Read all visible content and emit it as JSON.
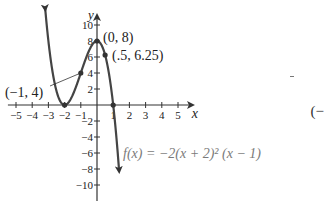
{
  "chart_data": {
    "type": "line",
    "title": "",
    "xlabel": "x",
    "ylabel": "y",
    "function_label": "f(x) = −2(x + 2)² (x − 1)",
    "xlim": [
      -5.5,
      5.8
    ],
    "ylim": [
      -11.5,
      11.5
    ],
    "x_ticks": [
      -5,
      -4,
      -3,
      -2,
      -1,
      1,
      2,
      3,
      4,
      5
    ],
    "x_tick_labels": [
      "−5",
      "−4",
      "−3",
      "−2",
      "−1",
      "1",
      "2",
      "3",
      "4",
      "5"
    ],
    "y_ticks": [
      10,
      8,
      6,
      4,
      2,
      -2,
      -4,
      -6,
      -8,
      -10
    ],
    "y_tick_labels": [
      "10",
      "8",
      "6",
      "4",
      "2",
      "−2",
      "−4",
      "−6",
      "−8",
      "−10"
    ],
    "grid": false,
    "series": [
      {
        "name": "f(x) = -2(x+2)^2(x-1)",
        "x": [
          -3.2,
          -3,
          -2.5,
          -2,
          -1.5,
          -1,
          -0.5,
          0,
          0.5,
          1,
          1.3
        ],
        "y": [
          9.07,
          8,
          1.75,
          0,
          1.25,
          4,
          6.75,
          8,
          6.25,
          0,
          -6.34
        ]
      }
    ],
    "annotations": [
      {
        "label": "(0, 8)",
        "x": 0,
        "y": 8
      },
      {
        "label": "(.5, 6.25)",
        "x": 0.5,
        "y": 6.25
      },
      {
        "label": "(−1, 4)",
        "x": -1,
        "y": 4
      }
    ],
    "marked_points": [
      {
        "x": -2,
        "y": 0
      },
      {
        "x": 1,
        "y": 0
      },
      {
        "x": 0,
        "y": 8
      },
      {
        "x": 0.5,
        "y": 6.25
      },
      {
        "x": -1,
        "y": 4
      }
    ]
  },
  "side_text": "(−",
  "axis": {
    "x_label": "x",
    "y_label": "y"
  }
}
